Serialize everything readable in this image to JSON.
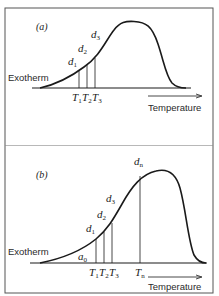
{
  "figure": {
    "panels": [
      {
        "label": "(a)",
        "y_axis_label": "Exotherm",
        "x_axis_label": "Temperature",
        "curve_labels": [
          {
            "base": "d",
            "sub": "1"
          },
          {
            "base": "d",
            "sub": "2"
          },
          {
            "base": "d",
            "sub": "3"
          }
        ],
        "temperature_labels": [
          {
            "base": "T",
            "sub": "1"
          },
          {
            "base": "T",
            "sub": "2"
          },
          {
            "base": "T",
            "sub": "3"
          }
        ]
      },
      {
        "label": "(b)",
        "y_axis_label": "Exotherm",
        "x_axis_label": "Temperature",
        "start_label": {
          "base": "a",
          "sub": "0"
        },
        "curve_labels": [
          {
            "base": "d",
            "sub": "1"
          },
          {
            "base": "d",
            "sub": "2"
          },
          {
            "base": "d",
            "sub": "3"
          },
          {
            "base": "d",
            "sub": "n"
          }
        ],
        "temperature_labels": [
          {
            "base": "T",
            "sub": "1"
          },
          {
            "base": "T",
            "sub": "2"
          },
          {
            "base": "T",
            "sub": "3"
          },
          {
            "base": "T",
            "sub": "n"
          }
        ]
      }
    ],
    "colors": {
      "line": "#1a1a1a",
      "frame": "#555555",
      "background": "#ffffff"
    }
  }
}
